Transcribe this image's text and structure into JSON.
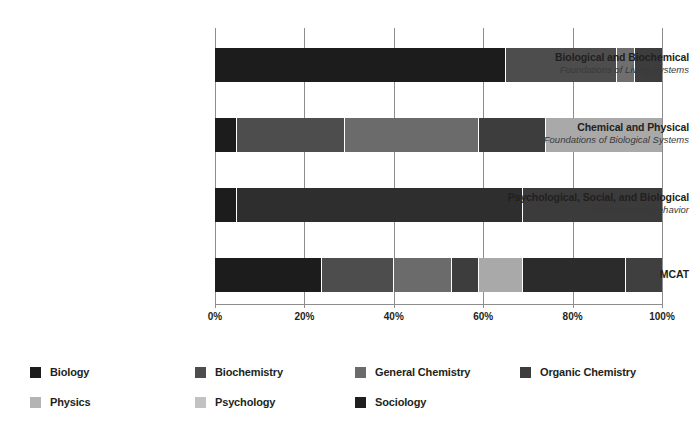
{
  "chart_data": {
    "type": "bar",
    "orientation": "horizontal",
    "stacked": true,
    "stack_mode": "percent",
    "title": "",
    "subtitle": "",
    "xlabel": "",
    "ylabel": "",
    "xlim": [
      0,
      100
    ],
    "xticks": [
      "0%",
      "20%",
      "40%",
      "60%",
      "80%",
      "100%"
    ],
    "xtick_values": [
      0,
      20,
      40,
      60,
      80,
      100
    ],
    "grid": true,
    "grid_axis": "x",
    "legend_position": "bottom",
    "categories": [
      "Biological and Biochemical Foundations of Living Systems",
      "Chemical and Physical Foundations of Biological Systems",
      "Psychological, Social, and Biological Foundations of Behavior",
      "MCAT"
    ],
    "category_labels": [
      {
        "line1": "Biological and Biochemical",
        "line2": "Foundations of Living Systems"
      },
      {
        "line1": "Chemical and Physical",
        "line2": "Foundations of Biological Systems"
      },
      {
        "line1": "Psychological, Social, and Biological",
        "line2": "Foundations of Behavior"
      },
      {
        "line1": "MCAT",
        "line2": ""
      }
    ],
    "series": [
      {
        "name": "Biology",
        "color": "#1c1c1c",
        "values": [
          65,
          5,
          5,
          24
        ]
      },
      {
        "name": "Biochemistry",
        "color": "#4d4d4d",
        "values": [
          25,
          24,
          0,
          16
        ]
      },
      {
        "name": "General Chemistry",
        "color": "#6b6b6b",
        "values": [
          0,
          30,
          0,
          13
        ]
      },
      {
        "name": "Organic Chemistry",
        "color": "#3d3d3d",
        "values": [
          4,
          15,
          0,
          6
        ]
      },
      {
        "name": "Physics",
        "color": "#a9a9a9",
        "values": [
          0,
          26,
          0,
          10
        ]
      },
      {
        "name": "Psychology",
        "color": "#b2b2b2",
        "values": [
          0,
          0,
          64,
          23
        ]
      },
      {
        "name": "Sociology",
        "color": "#2b2b2b",
        "values": [
          6,
          0,
          26,
          8
        ]
      }
    ],
    "bars": [
      {
        "category": "Biological and Biochemical Foundations of Living Systems",
        "segments": [
          {
            "name": "Biology",
            "value": 65,
            "color": "#1c1c1c"
          },
          {
            "name": "Biochemistry",
            "value": 25,
            "color": "#4d4d4d"
          },
          {
            "name": "Organic Chemistry",
            "value": 4,
            "color": "#6f6f6f"
          },
          {
            "name": "Sociology",
            "value": 6,
            "color": "#3d3d3d"
          }
        ]
      },
      {
        "category": "Chemical and Physical Foundations of Biological Systems",
        "segments": [
          {
            "name": "Biology",
            "value": 5,
            "color": "#1c1c1c"
          },
          {
            "name": "Biochemistry",
            "value": 24,
            "color": "#4d4d4d"
          },
          {
            "name": "General Chemistry",
            "value": 30,
            "color": "#6b6b6b"
          },
          {
            "name": "Organic Chemistry",
            "value": 15,
            "color": "#3d3d3d"
          },
          {
            "name": "Physics",
            "value": 26,
            "color": "#a9a9a9"
          }
        ]
      },
      {
        "category": "Psychological, Social, and Biological Foundations of Behavior",
        "segments": [
          {
            "name": "Biology",
            "value": 5,
            "color": "#1c1c1c"
          },
          {
            "name": "Psychology",
            "value": 64,
            "color": "#2e2e2e"
          },
          {
            "name": "Sociology",
            "value": 31,
            "color": "#3b3b3b"
          }
        ]
      },
      {
        "category": "MCAT",
        "segments": [
          {
            "name": "Biology",
            "value": 24,
            "color": "#1c1c1c"
          },
          {
            "name": "Biochemistry",
            "value": 16,
            "color": "#4d4d4d"
          },
          {
            "name": "General Chemistry",
            "value": 13,
            "color": "#6b6b6b"
          },
          {
            "name": "Organic Chemistry",
            "value": 6,
            "color": "#3d3d3d"
          },
          {
            "name": "Physics",
            "value": 10,
            "color": "#a9a9a9"
          },
          {
            "name": "Psychology",
            "value": 23,
            "color": "#2b2b2b"
          },
          {
            "name": "Sociology",
            "value": 8,
            "color": "#3f3f3f"
          }
        ]
      }
    ],
    "legend": [
      {
        "label": "Biology",
        "color": "#1c1c1c"
      },
      {
        "label": "Biochemistry",
        "color": "#4d4d4d"
      },
      {
        "label": "General Chemistry",
        "color": "#6b6b6b"
      },
      {
        "label": "Organic Chemistry",
        "color": "#3d3d3d"
      },
      {
        "label": "Physics",
        "color": "#b4b4b4"
      },
      {
        "label": "Psychology",
        "color": "#c2c2c2"
      },
      {
        "label": "Sociology",
        "color": "#1f1f1f"
      }
    ]
  },
  "colors": {
    "background": "#ffffff",
    "text": "#231f20",
    "grid": "#8d8d8d",
    "axis": "#8d8d8d"
  }
}
